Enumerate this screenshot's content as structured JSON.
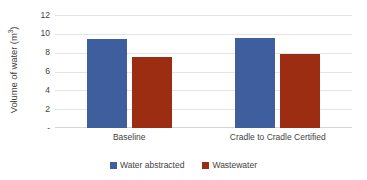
{
  "chart_data": {
    "type": "bar",
    "title": "",
    "xlabel": "",
    "ylabel": "Volume of water (m3)",
    "ylabel_base": "Volume of water (m",
    "ylabel_sup": "3",
    "ylabel_tail": ")",
    "categories": [
      "Baseline",
      "Cradle to Cradle Certified"
    ],
    "series": [
      {
        "name": "Water abstracted",
        "color": "#3f5e9e",
        "values": [
          9.4,
          9.55
        ]
      },
      {
        "name": "Wastewater",
        "color": "#9c2d13",
        "values": [
          7.5,
          7.9
        ]
      }
    ],
    "ylim": [
      0,
      12
    ],
    "y_ticks": [
      "12",
      "10",
      "8",
      "6",
      "4",
      "2",
      "-"
    ],
    "y_tick_values": [
      12,
      10,
      8,
      6,
      4,
      2,
      0
    ],
    "grid": true,
    "legend_position": "bottom"
  },
  "legend": {
    "items": [
      {
        "label": "Water abstracted",
        "color": "#3f5e9e"
      },
      {
        "label": "Wastewater",
        "color": "#9c2d13"
      }
    ]
  }
}
